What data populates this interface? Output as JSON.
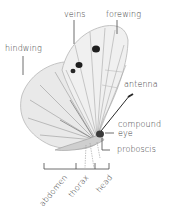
{
  "diagram": {
    "labels": {
      "veins": "veins",
      "forewing": "forewing",
      "hindwing": "hindwing",
      "antenna": "antenna",
      "compound_eye_1": "compound",
      "compound_eye_2": "eye",
      "proboscis": "proboscis",
      "abdomen": "abdomen",
      "thorax": "thorax",
      "head": "head"
    },
    "colors": {
      "label_text": "#3a3a3a",
      "leader_line": "#4a4a4a",
      "wing_fill": "#ebebeb",
      "vein": "#9a9a9a",
      "spot": "#1e1e1e"
    }
  }
}
